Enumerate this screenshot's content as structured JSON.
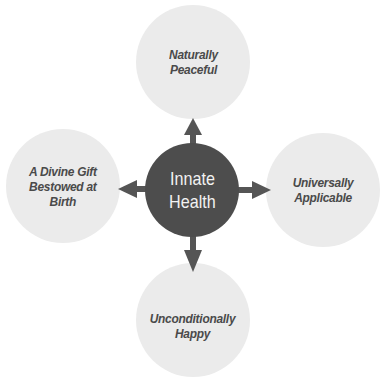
{
  "diagram": {
    "center": {
      "label_line1": "Innate",
      "label_line2": "Health"
    },
    "nodes": {
      "top": {
        "label_line1": "Naturally",
        "label_line2": "Peaceful"
      },
      "right": {
        "label_line1": "Universally",
        "label_line2": "Applicable"
      },
      "bottom": {
        "label_line1": "Unconditionally",
        "label_line2": "Happy"
      },
      "left": {
        "label_line1": "A Divine Gift",
        "label_line2": "Bestowed at",
        "label_line3": "Birth"
      }
    },
    "colors": {
      "center_fill": "#4d4d4d",
      "node_fill": "#ebebeb",
      "arrow": "#555555",
      "outer_text": "#4a4a4a",
      "center_text": "#f2f2f2"
    }
  }
}
